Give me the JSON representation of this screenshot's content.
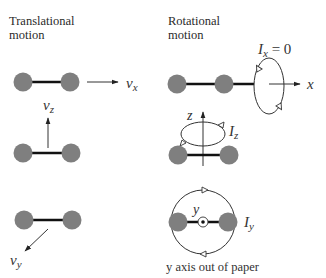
{
  "headings": {
    "translational": [
      "Translational",
      "motion"
    ],
    "rotational": [
      "Rotational",
      "motion"
    ]
  },
  "translational": {
    "vx": {
      "symbol": "v",
      "sub": "x"
    },
    "vz": {
      "symbol": "v",
      "sub": "z"
    },
    "vy": {
      "symbol": "v",
      "sub": "y"
    }
  },
  "rotational": {
    "ix": {
      "symbol": "I",
      "sub": "x",
      "suffix": " = 0"
    },
    "x_axis": "x",
    "z_axis": "z",
    "iz": {
      "symbol": "I",
      "sub": "z"
    },
    "y_axis": "y",
    "iy": {
      "symbol": "I",
      "sub": "y"
    },
    "caption": "y axis out of paper"
  },
  "colors": {
    "atom": "#7f7f7f",
    "bond": "#111111",
    "line": "#333333"
  }
}
